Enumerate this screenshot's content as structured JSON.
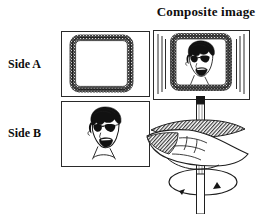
{
  "figure": {
    "title": "Composite image",
    "background_color": "#ffffff",
    "ink_color": "#1a1a1a",
    "panels": [
      {
        "id": "side-a",
        "label": "Side A",
        "content_description": "empty rounded-square frame with dark stippled border"
      },
      {
        "id": "side-b",
        "label": "Side B",
        "content_description": "line-drawn caricature face wearing dark sunglasses with open mouth"
      },
      {
        "id": "composite",
        "label": "Composite image",
        "content_description": "spinning card showing the stippled frame and the face superimposed, with vertical motion blur lines at left and right edges"
      }
    ],
    "apparatus": {
      "stick_description": "vertical hatched stick attached below the spinning card",
      "hand_description": "hand gripping the stick between the palm and fingers",
      "rotation_indicator": {
        "shape": "ellipse",
        "arrow_count": 2,
        "description": "ellipse with two arrowheads showing spin direction about the vertical axis"
      }
    }
  }
}
